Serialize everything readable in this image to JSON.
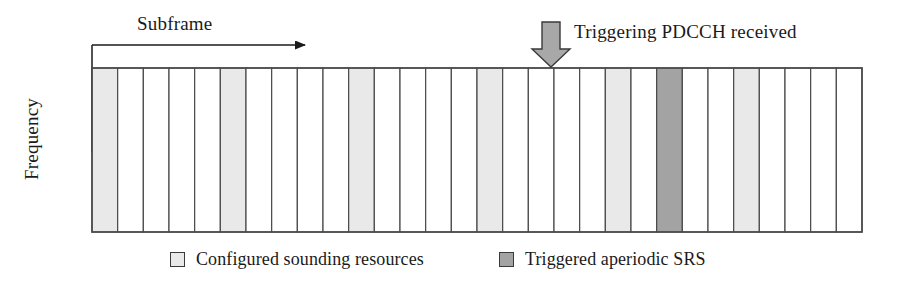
{
  "figure": {
    "axes": {
      "horizontal": {
        "label": "Subframe",
        "direction": "right",
        "icon": "arrow-right-icon"
      },
      "vertical": {
        "label": "Frequency",
        "direction": "down",
        "icon": "arrow-down-icon"
      }
    },
    "annotation": {
      "text": "Triggering PDCCH received",
      "icon": "block-arrow-down-icon",
      "points_to_column_index": 17
    },
    "legend": [
      {
        "label": "Configured sounding resources",
        "color": "#e9e9e9",
        "swatch": "legend-swatch-light"
      },
      {
        "label": "Triggered aperiodic SRS",
        "color": "#a3a3a3",
        "swatch": "legend-swatch-dark"
      }
    ]
  },
  "chart_data": {
    "type": "bar",
    "title": "",
    "xlabel": "Subframe",
    "ylabel": "Frequency",
    "grid": {
      "columns": 30,
      "x_start": 92,
      "x_end": 862,
      "y_top": 68,
      "y_bottom": 232,
      "column_width": 25.67,
      "border_color": "#4a4a4a",
      "empty_fill": "#ffffff"
    },
    "categories": [
      0,
      1,
      2,
      3,
      4,
      5,
      6,
      7,
      8,
      9,
      10,
      11,
      12,
      13,
      14,
      15,
      16,
      17,
      18,
      19,
      20,
      21,
      22,
      23,
      24,
      25,
      26,
      27,
      28,
      29
    ],
    "values": [
      2,
      0,
      0,
      0,
      0,
      1,
      0,
      0,
      0,
      0,
      1,
      0,
      0,
      0,
      0,
      1,
      0,
      0,
      0,
      0,
      1,
      0,
      3,
      0,
      0,
      1,
      0,
      0,
      0,
      0
    ],
    "value_legend": {
      "0": "empty subframe",
      "1": "configured sounding resource",
      "2": "configured sounding resource (first)",
      "3": "triggered aperiodic SRS"
    },
    "configured_sounding_columns": [
      0,
      5,
      10,
      15,
      20,
      25
    ],
    "triggered_aperiodic_srs_column": 22,
    "colors": {
      "configured": "#e9e9e9",
      "triggered": "#a3a3a3",
      "empty": "#ffffff",
      "stroke": "#4a4a4a"
    },
    "grid_on": false,
    "legend_position": "bottom"
  }
}
